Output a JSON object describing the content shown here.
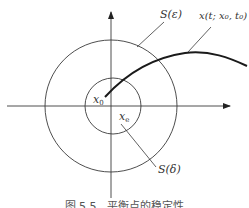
{
  "figure": {
    "labels": {
      "outer_region": "S(ε)",
      "inner_region": "S(δ)",
      "trajectory": "x(t; x₀, t₀)",
      "initial_point_base": "x",
      "initial_point_sub": "0",
      "equilibrium_base": "x",
      "equilibrium_sub": "e"
    },
    "caption": "图 5.5　平衡点的稳定性"
  },
  "colors": {
    "line": "#3a3a3a",
    "trajectory": "#1a1a1a",
    "text": "#333333",
    "background": "#ffffff"
  }
}
